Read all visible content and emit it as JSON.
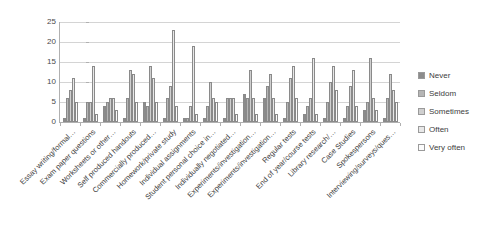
{
  "chart_data": {
    "type": "bar",
    "title": "",
    "xlabel": "",
    "ylabel": "",
    "ylim": [
      0,
      25
    ],
    "ytick_labels": [
      "0",
      "5",
      "10",
      "15",
      "20",
      "25"
    ],
    "yticks": [
      0,
      5,
      10,
      15,
      20,
      25
    ],
    "grid": true,
    "legend_position": "right",
    "categories": [
      "Essay writing/formal…",
      "Exam paper questions",
      "Worksheets or other…",
      "Self produced handouts",
      "Commercially produced…",
      "Homework/private study",
      "Individual assignments",
      "Student personal choice in…",
      "Individually negotiated…",
      "Experiments/investigation…",
      "Experiments/investigation…",
      "Regular tests",
      "End of year/course tests",
      "Library research/…",
      "Case Studies",
      "Spokespersons",
      "Interviewing/surveys/ques…"
    ],
    "series": [
      {
        "name": "Never",
        "color": "#8c8c8c",
        "values": [
          1,
          1,
          4,
          1,
          5,
          1,
          1,
          1,
          1,
          7,
          6,
          1,
          2,
          1,
          1,
          3,
          1
        ]
      },
      {
        "name": "Seldom",
        "color": "#b5b5b5",
        "values": [
          6,
          5,
          5,
          6,
          4,
          6,
          1,
          4,
          6,
          6,
          9,
          5,
          4,
          5,
          4,
          5,
          6
        ]
      },
      {
        "name": "Sometimes",
        "color": "#cfcfcf",
        "values": [
          8,
          5,
          6,
          13,
          14,
          9,
          4,
          10,
          6,
          13,
          12,
          11,
          6,
          10,
          9,
          16,
          12
        ]
      },
      {
        "name": "Often",
        "color": "#e8e8e8",
        "values": [
          11,
          14,
          6,
          12,
          11,
          23,
          19,
          6,
          6,
          6,
          6,
          14,
          16,
          14,
          13,
          6,
          8
        ]
      },
      {
        "name": "Very often",
        "color": "#fcfcfc",
        "values": [
          5,
          2,
          3,
          5,
          5,
          4,
          2,
          5,
          2,
          2,
          2,
          6,
          2,
          8,
          4,
          3,
          5
        ]
      }
    ]
  },
  "legend": {
    "items": [
      {
        "label": "Never"
      },
      {
        "label": "Seldom"
      },
      {
        "label": "Sometimes"
      },
      {
        "label": "Often"
      },
      {
        "label": "Very often"
      }
    ]
  }
}
